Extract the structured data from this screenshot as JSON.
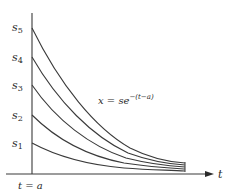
{
  "diagram": {
    "equation": {
      "lhs": "x = se",
      "exponent": "−(t−a)"
    },
    "axis": {
      "horizontal_label": "t",
      "vertical_marker_label": "t = a"
    },
    "curve_labels": [
      {
        "name": "s",
        "sub": "5"
      },
      {
        "name": "s",
        "sub": "4"
      },
      {
        "name": "s",
        "sub": "3"
      },
      {
        "name": "s",
        "sub": "2"
      },
      {
        "name": "s",
        "sub": "1"
      }
    ],
    "colors": {
      "line": "#3a3a3a",
      "text": "#2a2a2a"
    }
  }
}
